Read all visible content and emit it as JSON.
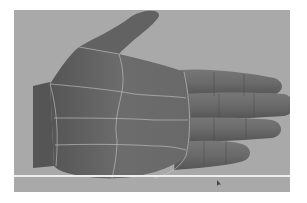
{
  "scene": {
    "subject": "3D hand model with wireframe topology lines",
    "colors": {
      "background": "#a9a9a9",
      "skin": "#6a6a6a",
      "skin_shadow": "#4e4e4e",
      "wire": "#c8c8c8",
      "ground_line": "#efefef"
    }
  }
}
